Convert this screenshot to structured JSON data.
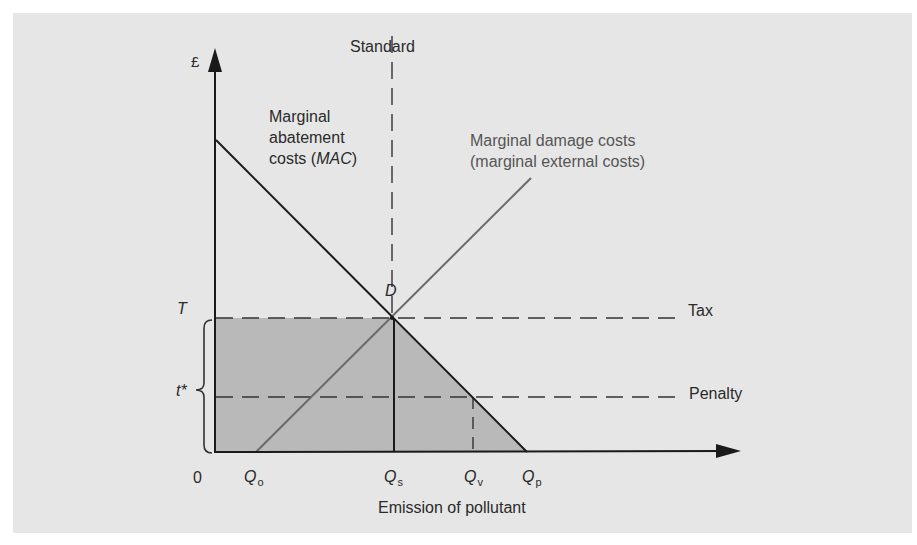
{
  "diagram": {
    "type": "economics-pollution-policy",
    "y_axis_label": "£",
    "x_axis_label": "Emission of pollutant",
    "origin_label": "0",
    "standard_label": "Standard",
    "mac_label": {
      "line1": "Marginal",
      "line2": "abatement",
      "line3_prefix": "costs (",
      "line3_italic": "MAC",
      "line3_suffix": ")"
    },
    "mdc_label": {
      "line1": "Marginal damage costs",
      "line2": "(marginal external costs)"
    },
    "point_label": "D",
    "tax_label": "Tax",
    "penalty_label": "Penalty",
    "T_label": "T",
    "tstar_label": "t*",
    "x_ticks": [
      {
        "main": "Q",
        "sub": "o"
      },
      {
        "main": "Q",
        "sub": "s"
      },
      {
        "main": "Q",
        "sub": "v"
      },
      {
        "main": "Q",
        "sub": "p"
      }
    ],
    "colors": {
      "background": "#e6e6e6",
      "shade": "#b9b9b9",
      "mac_line": "#1a1a1a",
      "mdc_line": "#6a6a6a",
      "dashed": "#333333"
    }
  }
}
